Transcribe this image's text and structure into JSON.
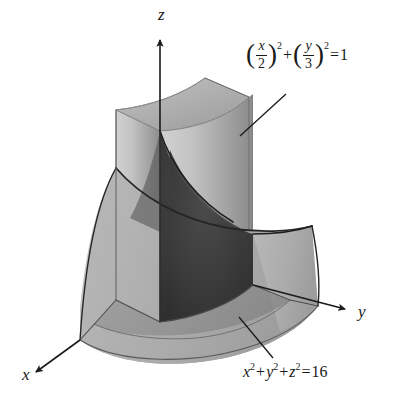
{
  "figure": {
    "kind": "3d-solid-diagram",
    "background_color": "#ffffff",
    "ink_color": "#1a1a1a"
  },
  "axes": [
    {
      "id": "z",
      "label": "z",
      "direction": "up",
      "label_x": 158,
      "label_y": 6
    },
    {
      "id": "y",
      "label": "y",
      "direction": "right-down",
      "label_x": 360,
      "label_y": 315
    },
    {
      "id": "x",
      "label": "x",
      "direction": "left-down",
      "label_x": 24,
      "label_y": 370
    }
  ],
  "annotations": [
    {
      "id": "cylinder-equation",
      "text": "(x/2)^2 + (y/3)^2 = 1",
      "parts": {
        "num1": "x",
        "den1": "2",
        "exp1": "2",
        "plus": "+",
        "num2": "y",
        "den2": "3",
        "exp2": "2",
        "equals": "=",
        "rhs": "1"
      },
      "leader": {
        "from_x": 240,
        "from_y": 136,
        "to_x": 286,
        "to_y": 94
      }
    },
    {
      "id": "sphere-equation",
      "text": "x^2 + y^2 + z^2 = 16",
      "parts": {
        "v1": "x",
        "e1": "2",
        "plus1": "+",
        "v2": "y",
        "e2": "2",
        "plus2": "+",
        "v3": "z",
        "e3": "2",
        "equals": "=",
        "rhs": "16"
      },
      "leader": {
        "from_x": 239,
        "from_y": 317,
        "to_x": 273,
        "to_y": 358
      }
    }
  ],
  "surfaces": {
    "cylinder_light": "#c9c9c9",
    "cylinder_mid": "#9a9a9a",
    "cylinder_dark": "#828282",
    "sphere_light": "#bdbdbd",
    "sphere_mid": "#a6a6a6",
    "interior_dark": "#3c3c3c",
    "interior_darker": "#2f2f2f",
    "base_gray": "#a8a8a8",
    "top_cap": "#b4b4b4"
  }
}
